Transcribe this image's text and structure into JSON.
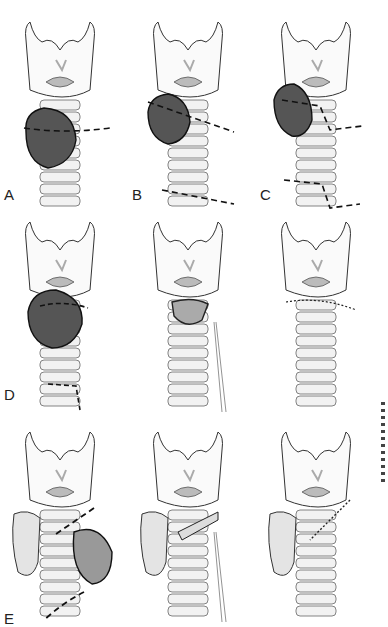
{
  "figure": {
    "panels": [
      {
        "id": "A",
        "label": "A",
        "x": 0,
        "y": 0,
        "tumor": "lower-left",
        "cuts": "two-horizontal"
      },
      {
        "id": "B",
        "label": "B",
        "x": 128,
        "y": 0,
        "tumor": "upper-left",
        "cuts": "oblique",
        "signature": true
      },
      {
        "id": "C",
        "label": "C",
        "x": 256,
        "y": 0,
        "tumor": "upper-left-laryngeal",
        "cuts": "stepped"
      },
      {
        "id": "D",
        "label": "D",
        "x": 0,
        "y": 200,
        "tumor": "cricoid",
        "cuts": "dashed-cricoid"
      },
      {
        "id": "D2",
        "label": "",
        "x": 128,
        "y": 200,
        "tumor": "resected",
        "cuts": "retracted",
        "signature": true
      },
      {
        "id": "D3",
        "label": "",
        "x": 256,
        "y": 200,
        "tumor": "none",
        "cuts": "sutured"
      },
      {
        "id": "E",
        "label": "E",
        "x": 0,
        "y": 410,
        "tumor": "thyroid",
        "cuts": "oblique-thyroid"
      },
      {
        "id": "E2",
        "label": "",
        "x": 128,
        "y": 410,
        "tumor": "thyroid-resected",
        "cuts": "retracted",
        "signature": true
      },
      {
        "id": "E3",
        "label": "",
        "x": 256,
        "y": 410,
        "tumor": "thyroid-lobe",
        "cuts": "oblique-sutured"
      }
    ]
  }
}
